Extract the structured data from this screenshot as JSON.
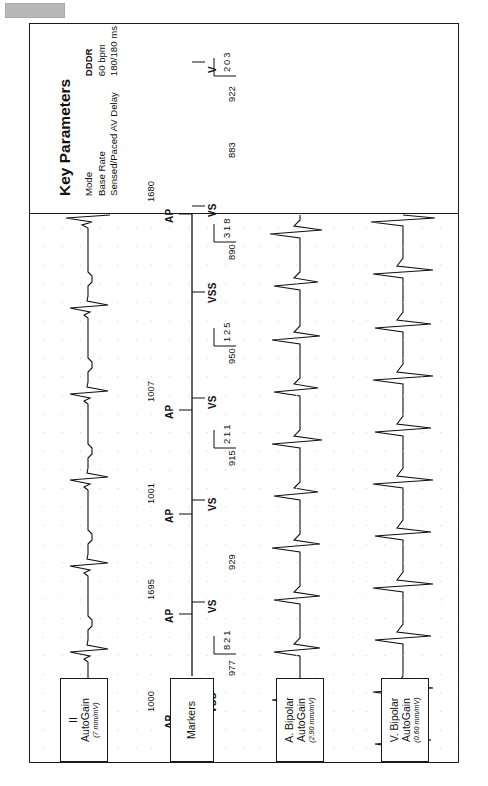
{
  "page": {
    "chip_label": ""
  },
  "strip": {
    "channels": [
      {
        "id": "surface-ecg",
        "name": "II",
        "gain_label": "AutoGain",
        "gain_value": "(7 mm/mV)"
      },
      {
        "id": "markers",
        "name": "Markers",
        "gain_label": "",
        "gain_value": ""
      },
      {
        "id": "atrial-egm",
        "name": "A. Bipolar",
        "gain_label": "AutoGain",
        "gain_value": "(2.90 mm/mV)"
      },
      {
        "id": "ventricular-egm",
        "name": "V. Bipolar",
        "gain_label": "AutoGain",
        "gain_value": "(0.60 mm/mV)"
      }
    ],
    "markers": {
      "atrial": [
        {
          "label": "AP",
          "x": 42
        },
        {
          "label": "AP",
          "x": 148
        },
        {
          "label": "AP",
          "x": 248
        },
        {
          "label": "AP",
          "x": 352
        },
        {
          "label": "AP",
          "x": 548
        }
      ],
      "ventricular": [
        {
          "label": "VSS",
          "x": 60
        },
        {
          "label": "VS",
          "x": 160
        },
        {
          "label": "VS",
          "x": 262
        },
        {
          "label": "VS",
          "x": 364
        },
        {
          "label": "VSS",
          "x": 470
        },
        {
          "label": "VS",
          "x": 556
        },
        {
          "label": "V",
          "x": 700
        }
      ],
      "intervals_upper": [
        {
          "value": "1000",
          "x": 50
        },
        {
          "value": "1001",
          "x": 258
        },
        {
          "value": "1007",
          "x": 360
        },
        {
          "value": "1695",
          "x": 162
        },
        {
          "value": "1680",
          "x": 560
        }
      ],
      "intervals_lower": [
        {
          "value": "977",
          "x": 86
        },
        {
          "value": "929",
          "x": 192
        },
        {
          "value": "915",
          "x": 296
        },
        {
          "value": "950",
          "x": 398
        },
        {
          "value": "890",
          "x": 502
        },
        {
          "value": "883",
          "x": 604
        },
        {
          "value": "922",
          "x": 660
        }
      ],
      "interval_stacks": [
        {
          "digits": "821",
          "x": 112
        },
        {
          "digits": "211",
          "x": 318
        },
        {
          "digits": "125",
          "x": 420
        },
        {
          "digits": "318",
          "x": 524
        },
        {
          "digits": "203",
          "x": 690
        }
      ]
    }
  },
  "key_parameters": {
    "heading": "Key Parameters",
    "rows": [
      {
        "label": "Mode",
        "value": "DDDR",
        "bold_value": true,
        "label2": "Max Track Rate",
        "value2": "120 bpm",
        "label3": "Ventricular Intrinsic Preference",
        "value3": "100 ms"
      },
      {
        "label": "Base Rate",
        "value": "60 bpm",
        "bold_value": false,
        "label2": "Max Sensor Rate",
        "value2": "130 bpm",
        "label3": "Rate Responsive PVARP/VREF",
        "value3": "Low"
      },
      {
        "label": "Sensed/Paced AV Delay",
        "value": "180/180 ms",
        "bold_value": false,
        "label2": "AutoCapture",
        "value2": "On",
        "label3": "",
        "value3": ""
      }
    ]
  }
}
